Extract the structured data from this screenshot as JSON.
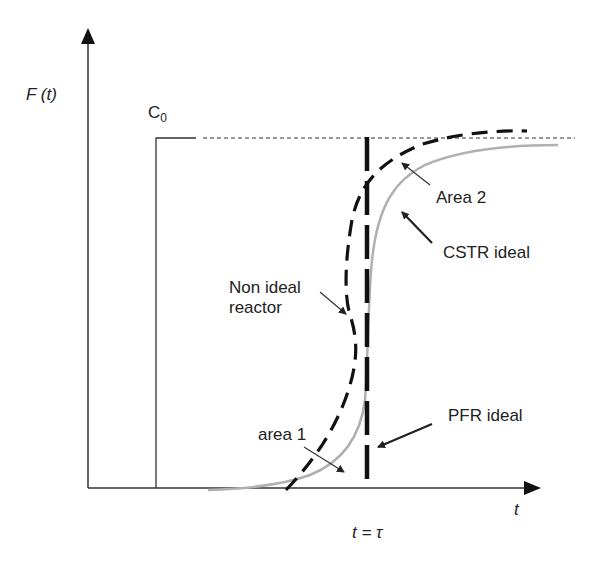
{
  "figure": {
    "y_axis_label": "F (t)",
    "x_axis_label": "t",
    "tau_label": "t = τ",
    "c0_label": "C",
    "c0_subscript": "0",
    "annotations": {
      "area2": "Area 2",
      "cstr": "CSTR ideal",
      "non_ideal_line1": "Non ideal",
      "non_ideal_line2": "reactor",
      "pfr": "PFR ideal",
      "area1": "area 1"
    }
  },
  "colors": {
    "axis": "#222222",
    "cstr_curve": "#b0b0b0",
    "non_ideal_curve": "#111111",
    "pfr_line": "#111111"
  }
}
